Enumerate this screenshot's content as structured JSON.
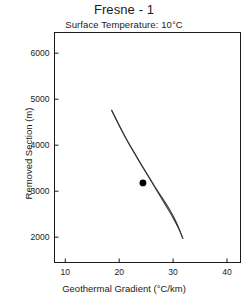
{
  "chart_data": {
    "type": "line",
    "title": "Fresne - 1",
    "subtitle": "Surface Temperature: 10°C",
    "xlabel": "Geothermal Gradient (°C/km)",
    "ylabel": "Removed Section (m)",
    "xlim": [
      8,
      42.5
    ],
    "ylim": [
      1450,
      6450
    ],
    "xticks": [
      10,
      20,
      30,
      40
    ],
    "xticklabels": [
      "10",
      "20",
      "30",
      "40"
    ],
    "yticks": [
      2000,
      3000,
      4000,
      5000,
      6000
    ],
    "yticklabels": [
      "2000",
      "3000",
      "4000",
      "5000",
      "6000"
    ],
    "grid": false,
    "legend": null,
    "series": [
      {
        "name": "upper-bound-curve",
        "x": [
          18.6,
          19.6,
          20.8,
          22.1,
          23.5,
          25.0,
          26.5,
          28.0,
          29.4,
          30.7,
          31.8
        ],
        "y": [
          4760,
          4520,
          4250,
          3970,
          3690,
          3400,
          3120,
          2850,
          2590,
          2300,
          1975
        ]
      },
      {
        "name": "lower-bound-curve",
        "x": [
          18.6,
          20.0,
          21.4,
          22.9,
          24.4,
          25.9,
          27.3,
          28.7,
          30.0,
          31.1,
          31.8
        ],
        "y": [
          4760,
          4430,
          4120,
          3820,
          3520,
          3230,
          2950,
          2680,
          2420,
          2170,
          1975
        ]
      }
    ],
    "points": [
      {
        "name": "best-estimate-point",
        "x": 24.4,
        "y": 3180,
        "marker": "filled-circle",
        "color": "#000000"
      }
    ],
    "colors": {
      "curve": "#3a3a3a",
      "axis": "#1a1a1a",
      "marker": "#000000",
      "background": "#ffffff"
    }
  }
}
